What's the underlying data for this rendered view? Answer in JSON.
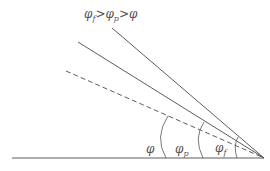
{
  "title_parts": {
    "a": "φ",
    "a_sub": "f",
    "gt1": ">",
    "b": "φ",
    "b_sub": "p",
    "gt2": ">",
    "c": "φ"
  },
  "angles": [
    {
      "id": "phi",
      "label": "φ",
      "sub": "",
      "line_style": "dashed"
    },
    {
      "id": "phi_p",
      "label": "φ",
      "sub": "p",
      "line_style": "solid"
    },
    {
      "id": "phi_f",
      "label": "φ",
      "sub": "f",
      "line_style": "solid"
    }
  ],
  "colors": {
    "line": "#4a4a4a",
    "text": "#555555"
  }
}
